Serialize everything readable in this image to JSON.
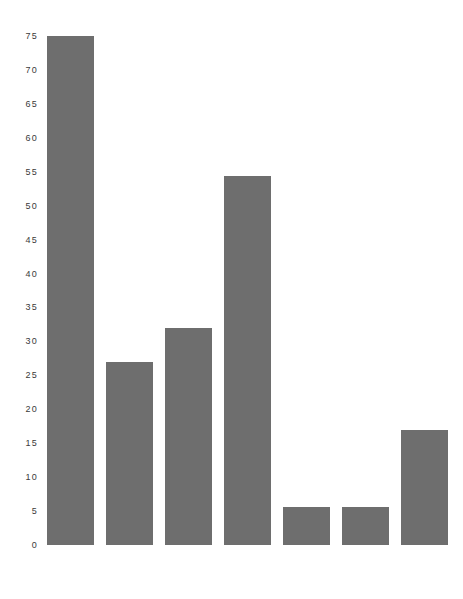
{
  "chart_data": {
    "type": "bar",
    "title": "",
    "subtitle": "",
    "xlabel": "",
    "ylabel": "",
    "categories": [
      "UNITED\nSTATES",
      "CANADA",
      "AUSTRALIA",
      "FRANCE",
      "ENGLAND\nAND WALES",
      "WEST\nGERMANY",
      "JAPAN"
    ],
    "values": [
      75,
      27,
      32,
      54.3,
      5.6,
      5.6,
      17
    ],
    "ylim": [
      0,
      75
    ],
    "ytick_labels": [
      "0",
      "5",
      "10",
      "15",
      "20",
      "25",
      "30",
      "35",
      "40",
      "45",
      "50",
      "55",
      "60",
      "65",
      "70",
      "75"
    ],
    "ytick_values": [
      0,
      5,
      10,
      15,
      20,
      25,
      30,
      35,
      40,
      45,
      50,
      55,
      60,
      65,
      70,
      75
    ],
    "grid": false,
    "legend": null,
    "bar_color": "#6e6e6e",
    "background_color": "#ffffff",
    "axis_line": false
  }
}
